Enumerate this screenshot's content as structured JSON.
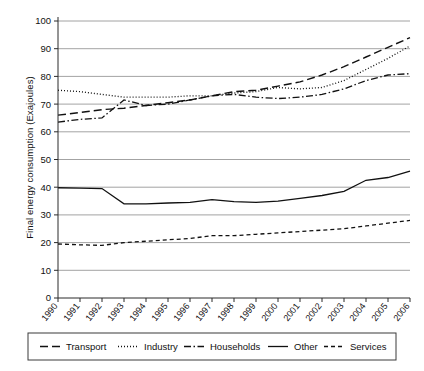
{
  "chart_data": {
    "type": "line",
    "title": "",
    "xlabel": "",
    "ylabel": "Final energy consumption (Exajoules)",
    "ylim": [
      0,
      100
    ],
    "ytick_step": 10,
    "yticks": [
      0,
      10,
      20,
      30,
      40,
      50,
      60,
      70,
      80,
      90,
      100
    ],
    "grid": true,
    "legend_position": "bottom",
    "categories": [
      1990,
      1991,
      1992,
      1993,
      1994,
      1995,
      1996,
      1997,
      1998,
      1999,
      2000,
      2001,
      2002,
      2003,
      2004,
      2005,
      2006
    ],
    "x": [
      "1990",
      "1991",
      "1992",
      "1993",
      "1994",
      "1995",
      "1996",
      "1997",
      "1998",
      "1999",
      "2000",
      "2001",
      "2002",
      "2003",
      "2004",
      "2005",
      "2006"
    ],
    "series": [
      {
        "name": "Transport",
        "style": "long-dash",
        "values": [
          66.0,
          67.0,
          68.0,
          68.5,
          69.5,
          70.5,
          71.5,
          73.0,
          74.5,
          75.0,
          76.5,
          78.0,
          80.5,
          83.5,
          87.0,
          90.5,
          94.0
        ]
      },
      {
        "name": "Industry",
        "style": "dotted",
        "values": [
          75.0,
          74.5,
          73.5,
          72.5,
          72.5,
          72.5,
          73.0,
          73.0,
          74.0,
          74.5,
          76.0,
          75.5,
          76.0,
          78.5,
          82.5,
          86.5,
          91.0
        ]
      },
      {
        "name": "Households",
        "style": "dash-dot",
        "values": [
          63.5,
          64.5,
          65.0,
          71.5,
          69.5,
          70.0,
          71.5,
          73.0,
          73.5,
          72.5,
          72.0,
          72.5,
          73.5,
          75.5,
          78.5,
          80.5,
          81.0
        ]
      },
      {
        "name": "Other",
        "style": "solid",
        "values": [
          39.8,
          39.7,
          39.5,
          34.0,
          34.0,
          34.3,
          34.5,
          35.5,
          34.8,
          34.5,
          35.0,
          36.0,
          37.0,
          38.5,
          42.5,
          43.5,
          45.8
        ]
      },
      {
        "name": "Services",
        "style": "short-dash",
        "values": [
          19.5,
          19.2,
          19.0,
          20.0,
          20.5,
          21.0,
          21.5,
          22.5,
          22.5,
          23.0,
          23.5,
          24.0,
          24.5,
          25.0,
          26.0,
          27.0,
          28.0
        ]
      }
    ],
    "legend": [
      {
        "label": "Transport",
        "style": "long-dash"
      },
      {
        "label": "Industry",
        "style": "dotted"
      },
      {
        "label": "Households",
        "style": "dash-dot"
      },
      {
        "label": "Other",
        "style": "solid"
      },
      {
        "label": "Services",
        "style": "short-dash"
      }
    ],
    "colors": {
      "series": "#111111",
      "grid": "#8c8c8c",
      "axis": "#2b2b2b",
      "background": "#ffffff"
    }
  }
}
